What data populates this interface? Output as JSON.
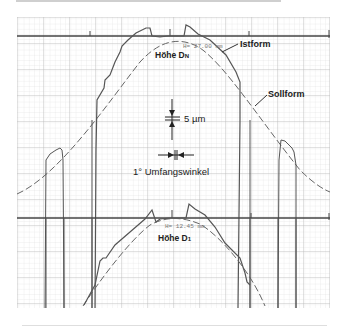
{
  "figure": {
    "labels": {
      "istform": "Istform",
      "sollform": "Sollform",
      "hoehe_dn": "Höhe D",
      "hoehe_dn_sub": "N",
      "hoehe_d1": "Höhe D",
      "hoehe_d1_sub": "1",
      "scale_vertical": "5 µm",
      "scale_horizontal": "1° Umfangswinkel",
      "height_dn_readout": "H= 27.00 mm",
      "height_d1_readout": "H= 12.45 mm"
    },
    "colors": {
      "grid_minor": "#d9d9d9",
      "grid_major": "#b5b5b5",
      "trace": "#555555",
      "axis": "#444444",
      "text": "#222222"
    }
  }
}
